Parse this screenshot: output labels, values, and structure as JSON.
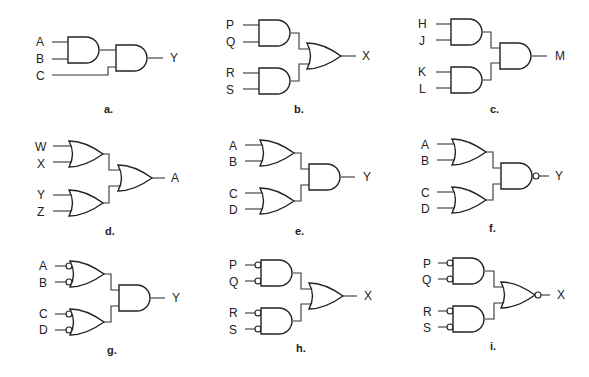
{
  "figure": {
    "type": "logic-gate-circuits",
    "panels": [
      {
        "id": "a",
        "caption": "a.",
        "inputs": [
          "A",
          "B",
          "C"
        ],
        "output": "Y",
        "first_stage": [
          "AND(A,B)"
        ],
        "final_gate": "AND",
        "final_inputs": [
          "AND(A,B)",
          "C"
        ],
        "input_inversions": false,
        "output_inversion": false
      },
      {
        "id": "b",
        "caption": "b.",
        "inputs": [
          "P",
          "Q",
          "R",
          "S"
        ],
        "output": "X",
        "first_stage": [
          "AND(P,Q)",
          "AND(R,S)"
        ],
        "final_gate": "OR",
        "input_inversions": false,
        "output_inversion": false
      },
      {
        "id": "c",
        "caption": "c.",
        "inputs": [
          "H",
          "J",
          "K",
          "L"
        ],
        "output": "M",
        "first_stage": [
          "AND(H,J)",
          "AND(K,L)"
        ],
        "final_gate": "AND",
        "input_inversions": false,
        "output_inversion": false
      },
      {
        "id": "d",
        "caption": "d.",
        "inputs": [
          "W",
          "X",
          "Y",
          "Z"
        ],
        "output": "A",
        "first_stage": [
          "OR(W,X)",
          "OR(Y,Z)"
        ],
        "final_gate": "OR",
        "input_inversions": false,
        "output_inversion": false
      },
      {
        "id": "e",
        "caption": "e.",
        "inputs": [
          "A",
          "B",
          "C",
          "D"
        ],
        "output": "Y",
        "first_stage": [
          "OR(A,B)",
          "OR(C,D)"
        ],
        "final_gate": "AND",
        "input_inversions": false,
        "output_inversion": false
      },
      {
        "id": "f",
        "caption": "f.",
        "inputs": [
          "A",
          "B",
          "C",
          "D"
        ],
        "output": "Y",
        "first_stage": [
          "OR(A,B)",
          "OR(C,D)"
        ],
        "final_gate": "NAND",
        "input_inversions": false,
        "output_inversion": true
      },
      {
        "id": "g",
        "caption": "g.",
        "inputs": [
          "A",
          "B",
          "C",
          "D"
        ],
        "output": "Y",
        "first_stage": [
          "OR(A',B')",
          "OR(C',D')"
        ],
        "final_gate": "AND",
        "input_inversions": true,
        "output_inversion": false
      },
      {
        "id": "h",
        "caption": "h.",
        "inputs": [
          "P",
          "Q",
          "R",
          "S"
        ],
        "output": "X",
        "first_stage": [
          "AND(P',Q')",
          "AND(R',S')"
        ],
        "final_gate": "OR",
        "input_inversions": true,
        "output_inversion": false
      },
      {
        "id": "i",
        "caption": "i.",
        "inputs": [
          "P",
          "Q",
          "R",
          "S"
        ],
        "output": "X",
        "first_stage": [
          "AND(P',Q')",
          "AND(R',S')"
        ],
        "final_gate": "NOR",
        "input_inversions": true,
        "output_inversion": true
      }
    ]
  },
  "labels": {
    "a": {
      "in1": "A",
      "in2": "B",
      "in3": "C",
      "out": "Y",
      "caption": "a."
    },
    "b": {
      "in1": "P",
      "in2": "Q",
      "in3": "R",
      "in4": "S",
      "out": "X",
      "caption": "b."
    },
    "c": {
      "in1": "H",
      "in2": "J",
      "in3": "K",
      "in4": "L",
      "out": "M",
      "caption": "c."
    },
    "d": {
      "in1": "W",
      "in2": "X",
      "in3": "Y",
      "in4": "Z",
      "out": "A",
      "caption": "d."
    },
    "e": {
      "in1": "A",
      "in2": "B",
      "in3": "C",
      "in4": "D",
      "out": "Y",
      "caption": "e."
    },
    "f": {
      "in1": "A",
      "in2": "B",
      "in3": "C",
      "in4": "D",
      "out": "Y",
      "caption": "f."
    },
    "g": {
      "in1": "A",
      "in2": "B",
      "in3": "C",
      "in4": "D",
      "out": "Y",
      "caption": "g."
    },
    "h": {
      "in1": "P",
      "in2": "Q",
      "in3": "R",
      "in4": "S",
      "out": "X",
      "caption": "h."
    },
    "i": {
      "in1": "P",
      "in2": "Q",
      "in3": "R",
      "in4": "S",
      "out": "X",
      "caption": "i."
    }
  },
  "colors": {
    "stroke": "#222222",
    "background": "#ffffff",
    "text": "#222222"
  }
}
